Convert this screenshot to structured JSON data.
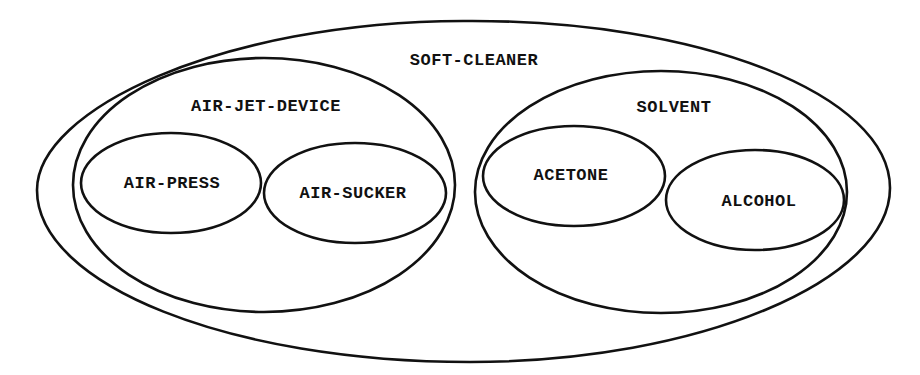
{
  "diagram": {
    "type": "euler-diagram",
    "stroke_color": "#111111",
    "background": "#ffffff",
    "sets": [
      {
        "id": "soft-cleaner",
        "label": "SOFT-CLEANER",
        "parent": null
      },
      {
        "id": "air-jet-device",
        "label": "AIR-JET-DEVICE",
        "parent": "soft-cleaner"
      },
      {
        "id": "air-press",
        "label": "AIR-PRESS",
        "parent": "air-jet-device"
      },
      {
        "id": "air-sucker",
        "label": "AIR-SUCKER",
        "parent": "air-jet-device"
      },
      {
        "id": "solvent",
        "label": "SOLVENT",
        "parent": "soft-cleaner"
      },
      {
        "id": "acetone",
        "label": "ACETONE",
        "parent": "solvent"
      },
      {
        "id": "alcohol",
        "label": "ALCOHOL",
        "parent": "solvent"
      }
    ]
  }
}
